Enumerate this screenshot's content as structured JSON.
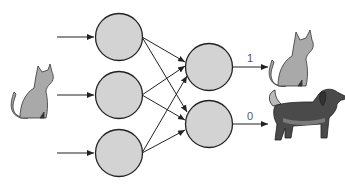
{
  "diagram": {
    "title": "",
    "input_image": "cat-icon",
    "input_nodes": 3,
    "output_nodes": [
      {
        "label": "1",
        "target_image": "cat-icon"
      },
      {
        "label": "0",
        "target_image": "dog-icon"
      }
    ],
    "colors": {
      "node_fill": "#d3d3d3",
      "node_stroke": "#222222",
      "edge": "#222222",
      "cat": "#a9a9a9",
      "dog": "#4a4a4a",
      "dog_light": "#7a7a7a"
    }
  }
}
